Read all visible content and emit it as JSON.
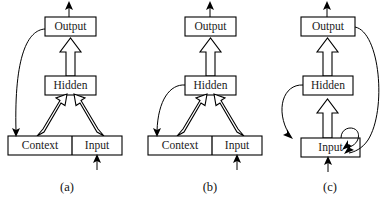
{
  "figure": {
    "type": "diagram",
    "background_color": "#ffffff",
    "line_color": "#000000",
    "fill_color": "#ffffff"
  },
  "panels": [
    {
      "id": "a",
      "caption": "(a)",
      "caption_x": 67,
      "caption_y": 191,
      "nodes": [
        {
          "name": "output",
          "label": "Output"
        },
        {
          "name": "hidden",
          "label": "Hidden"
        },
        {
          "name": "context",
          "label": "Context"
        },
        {
          "name": "input",
          "label": "Input"
        }
      ],
      "recurrent_connection": "output-to-context"
    },
    {
      "id": "b",
      "caption": "(b)",
      "caption_x": 210,
      "caption_y": 191,
      "nodes": [
        {
          "name": "output",
          "label": "Output"
        },
        {
          "name": "hidden",
          "label": "Hidden"
        },
        {
          "name": "context",
          "label": "Context"
        },
        {
          "name": "input",
          "label": "Input"
        }
      ],
      "recurrent_connection": "hidden-to-context"
    },
    {
      "id": "c",
      "caption": "(c)",
      "caption_x": 330,
      "caption_y": 191,
      "nodes": [
        {
          "name": "output",
          "label": "Output"
        },
        {
          "name": "hidden",
          "label": "Hidden"
        },
        {
          "name": "input",
          "label": "Input"
        }
      ],
      "recurrent_connection": "output-to-input, hidden-to-input, input-self-loop"
    }
  ]
}
